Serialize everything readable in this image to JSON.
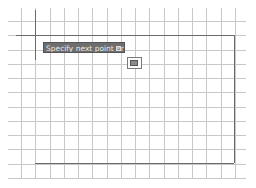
{
  "drawing": {
    "grid": {
      "line_color": "#c8c8c8",
      "boundary_color": "#6a6a6a",
      "background": "#ffffff"
    }
  },
  "tooltip": {
    "prompt_text": "Specify next point or",
    "expand_icon": "expand-options-icon",
    "background": "#6e6e6e"
  },
  "cursor": {
    "icon": "pickbox-cursor-icon"
  }
}
